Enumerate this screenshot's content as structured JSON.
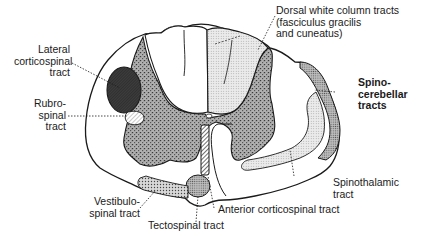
{
  "diagram": {
    "labels": {
      "lateral_corticospinal": [
        "Lateral",
        "corticospinal",
        "tract"
      ],
      "rubrospinal": [
        "Rubro-",
        "spinal",
        "tract"
      ],
      "vestibulospinal": [
        "Vestibulo-",
        "spinal tract"
      ],
      "tectospinal": [
        "Tectospinal tract"
      ],
      "anterior_corticospinal": [
        "Anterior corticospinal tract"
      ],
      "spinothalamic": [
        "Spinothalamic",
        "tract"
      ],
      "spinocerebellar": [
        "Spino-",
        "cerebellar",
        "tracts"
      ],
      "dorsal_white_column": [
        "Dorsal white column tracts",
        "(fasciculus gracilis",
        "and cuneatus)"
      ]
    },
    "colors": {
      "outline": "#1a1a1a",
      "grey_matter": "#8a8a8a",
      "dorsal_column_fill": "#d6d6d6",
      "lateral_corticospinal_fill": "#3a3a3a",
      "spinocerebellar_fill": "#9a9a9a",
      "spinothalamic_fill": "#d0d0d0",
      "tectospinal_fill": "#b8b8b8",
      "background": "#ffffff"
    }
  }
}
